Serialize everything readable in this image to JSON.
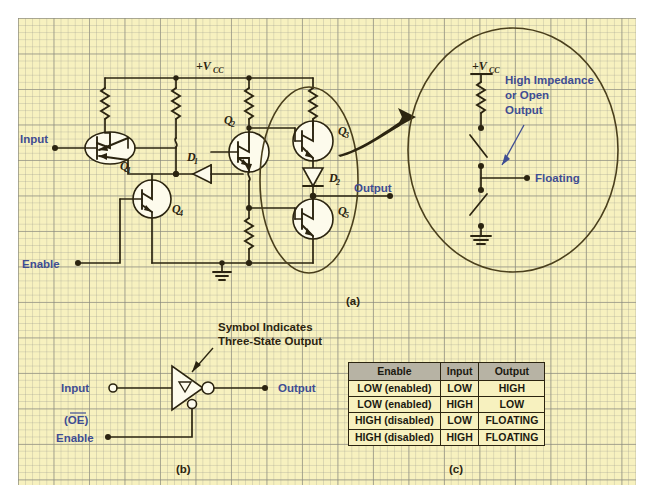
{
  "figure": {
    "panel_a_caption": "(a)",
    "panel_b_caption": "(b)",
    "panel_c_caption": "(c)"
  },
  "circuit_a": {
    "supply_label": "+V",
    "supply_sub": "CC",
    "input_label": "Input",
    "enable_label": "Enable",
    "output_label": "Output",
    "transistors": [
      {
        "id": "Q1",
        "letter": "Q",
        "sub": "1"
      },
      {
        "id": "Q2",
        "letter": "Q",
        "sub": "2"
      },
      {
        "id": "Q3",
        "letter": "Q",
        "sub": "3"
      },
      {
        "id": "Q4",
        "letter": "Q",
        "sub": "4"
      },
      {
        "id": "Q5",
        "letter": "Q",
        "sub": "5"
      }
    ],
    "diodes": [
      {
        "id": "D1",
        "letter": "D",
        "sub": "1"
      },
      {
        "id": "D2",
        "letter": "D",
        "sub": "2"
      }
    ]
  },
  "inset": {
    "supply_label": "+V",
    "supply_sub": "CC",
    "note_line1": "High Impedance",
    "note_line2": "or Open",
    "note_line3": "Output",
    "floating_label": "Floating"
  },
  "symbol_b": {
    "annotation_line1": "Symbol Indicates",
    "annotation_line2": "Three-State Output",
    "input_label": "Input",
    "output_label": "Output",
    "enable_label": "Enable",
    "oe_label": "(OE)"
  },
  "truth_table": {
    "headers": [
      "Enable",
      "Input",
      "Output"
    ],
    "rows": [
      [
        "LOW (enabled)",
        "LOW",
        "HIGH"
      ],
      [
        "LOW (enabled)",
        "HIGH",
        "LOW"
      ],
      [
        "HIGH (disabled)",
        "LOW",
        "FLOATING"
      ],
      [
        "HIGH (disabled)",
        "HIGH",
        "FLOATING"
      ]
    ],
    "group_break_after_row": 2
  },
  "colors": {
    "paper": "#f7f1bf",
    "ink": "#2b2410",
    "label_blue": "#3f4d93",
    "table_header": "#b7b3a4"
  }
}
